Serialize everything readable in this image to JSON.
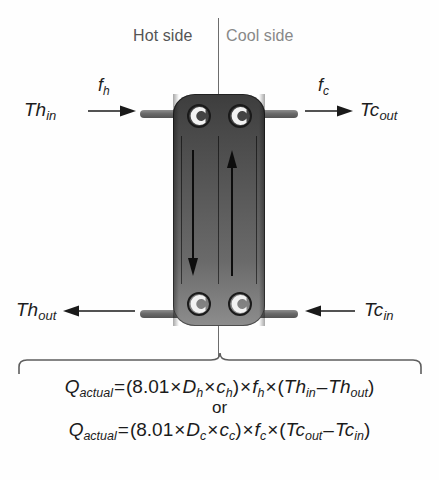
{
  "diagram": {
    "header": {
      "hot_side_label": "Hot side",
      "cool_side_label": "Cool side",
      "hot_side_color": "#555555",
      "cool_side_color": "#888888",
      "divider_color": "#6d6d6d"
    },
    "streams": [
      {
        "id": "hot-inlet",
        "label": "Th",
        "subscript": "in",
        "flow_label": "f",
        "flow_subscript": "h",
        "direction": "right",
        "position": "top-left"
      },
      {
        "id": "cool-outlet",
        "label": "Tc",
        "subscript": "out",
        "flow_label": "f",
        "flow_subscript": "c",
        "direction": "right",
        "position": "top-right"
      },
      {
        "id": "hot-outlet",
        "label": "Th",
        "subscript": "out",
        "direction": "left",
        "position": "bottom-left"
      },
      {
        "id": "cool-inlet",
        "label": "Tc",
        "subscript": "in",
        "direction": "left",
        "position": "bottom-right"
      }
    ],
    "internal_flows": [
      {
        "id": "hot-flow",
        "side": "hot",
        "direction": "down"
      },
      {
        "id": "cool-flow",
        "side": "cool",
        "direction": "up"
      }
    ],
    "ports": [
      {
        "id": "port-top-left",
        "shape": "c-ring",
        "opening": "right"
      },
      {
        "id": "port-top-right",
        "shape": "c-ring",
        "opening": "right"
      },
      {
        "id": "port-bottom-left",
        "shape": "c-ring",
        "opening": "right"
      },
      {
        "id": "port-bottom-right",
        "shape": "c-ring",
        "opening": "right"
      }
    ],
    "body": {
      "fill_top_color": "#3d3d3d",
      "fill_bottom_color": "#8d8d8d",
      "plate_line_color": "#000000"
    },
    "equations": {
      "connector": "or",
      "hot": {
        "lhs_var": "Q",
        "lhs_sub": "actual",
        "equals": "=",
        "open_paren": "(",
        "constant": "8.01",
        "times": "×",
        "density_var": "D",
        "density_sub": "h",
        "heatcap_var": "c",
        "heatcap_sub": "h",
        "close_paren": ")",
        "flow_var": "f",
        "flow_sub": "h",
        "temp_in_var": "Th",
        "temp_in_sub": "in",
        "minus": "–",
        "temp_out_var": "Th",
        "temp_out_sub": "out",
        "plain_text": "Qactual = (8.01 × Dh × ch) × fh × (Thin – Thout)"
      },
      "cool": {
        "lhs_var": "Q",
        "lhs_sub": "actual",
        "equals": "=",
        "open_paren": "(",
        "constant": "8.01",
        "times": "×",
        "density_var": "D",
        "density_sub": "c",
        "heatcap_var": "c",
        "heatcap_sub": "c",
        "close_paren": ")",
        "flow_var": "f",
        "flow_sub": "c",
        "temp_in_var": "Tc",
        "temp_in_sub": "out",
        "minus": "–",
        "temp_out_var": "Tc",
        "temp_out_sub": "in",
        "plain_text": "Qactual = (8.01 × Dc × cc) × fc × (Tcout – Tcin)"
      }
    }
  }
}
